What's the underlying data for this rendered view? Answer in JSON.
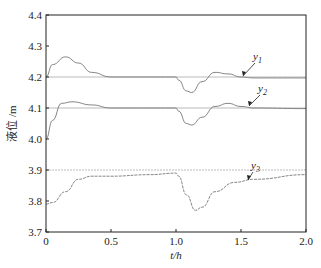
{
  "chart_data": {
    "type": "line",
    "title": "",
    "xlabel": "t/h",
    "ylabel": "液位 /m",
    "xlim": [
      0,
      2.0
    ],
    "ylim": [
      3.7,
      4.4
    ],
    "xticks": [
      "0",
      "0.5",
      "1.0",
      "1.5",
      "2.0"
    ],
    "yticks": [
      "3.7",
      "3.8",
      "3.9",
      "4.0",
      "4.1",
      "4.2",
      "4.3",
      "4.4"
    ],
    "grid": false,
    "setpoints": [
      4.2,
      4.1,
      3.9
    ],
    "series": [
      {
        "name": "y1",
        "x": [
          0,
          0.05,
          0.15,
          0.25,
          0.35,
          0.5,
          0.8,
          1.0,
          1.02,
          1.08,
          1.12,
          1.2,
          1.3,
          1.4,
          1.5,
          1.6,
          2.0
        ],
        "values": [
          4.2,
          4.24,
          4.265,
          4.245,
          4.215,
          4.2,
          4.2,
          4.2,
          4.19,
          4.155,
          4.15,
          4.185,
          4.215,
          4.21,
          4.2,
          4.197,
          4.197
        ]
      },
      {
        "name": "y2",
        "x": [
          0,
          0.05,
          0.12,
          0.2,
          0.35,
          0.5,
          0.8,
          1.0,
          1.02,
          1.08,
          1.12,
          1.2,
          1.3,
          1.4,
          1.5,
          1.6,
          2.0
        ],
        "values": [
          4.0,
          4.06,
          4.115,
          4.12,
          4.11,
          4.1,
          4.1,
          4.1,
          4.09,
          4.05,
          4.045,
          4.07,
          4.105,
          4.115,
          4.105,
          4.1,
          4.098
        ]
      },
      {
        "name": "y3",
        "x": [
          0,
          0.05,
          0.15,
          0.25,
          0.35,
          0.5,
          0.8,
          1.0,
          1.02,
          1.08,
          1.15,
          1.2,
          1.3,
          1.45,
          1.6,
          2.0
        ],
        "values": [
          3.79,
          3.795,
          3.83,
          3.87,
          3.88,
          3.88,
          3.885,
          3.89,
          3.88,
          3.82,
          3.77,
          3.78,
          3.83,
          3.86,
          3.87,
          3.885
        ]
      }
    ],
    "annotations": [
      "y1",
      "y2",
      "y3"
    ]
  }
}
